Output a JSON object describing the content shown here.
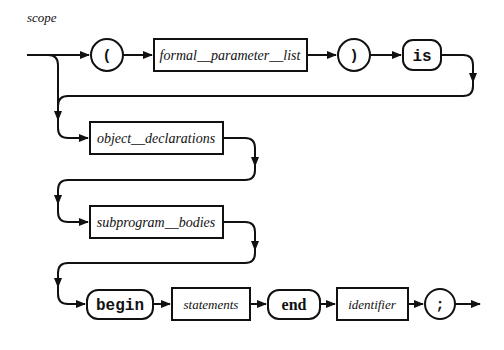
{
  "diagram": {
    "title": "scope",
    "row1": {
      "open_paren": "(",
      "formal_parameter_list": "formal__parameter__list",
      "close_paren": ")",
      "is": "is"
    },
    "row2": {
      "object_declarations": "object__declarations"
    },
    "row3": {
      "subprogram_bodies": "subprogram__bodies"
    },
    "row4": {
      "begin": "begin",
      "statements": "statements",
      "end": "end",
      "identifier": "identifier",
      "semicolon": ";"
    },
    "colors": {
      "stroke": "#111111",
      "background": "#ffffff"
    }
  }
}
